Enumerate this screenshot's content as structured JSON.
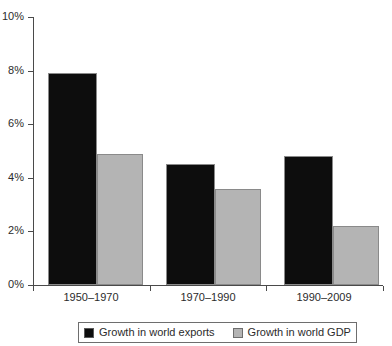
{
  "chart_data": {
    "type": "bar",
    "title": "",
    "subtitle": "",
    "xlabel": "",
    "ylabel": "",
    "categories": [
      "1950–1970",
      "1970–1990",
      "1990–2009"
    ],
    "series": [
      {
        "name": "Growth in world exports",
        "color": "#0d0d0d",
        "values": [
          7.9,
          4.5,
          4.8
        ]
      },
      {
        "name": "Growth in world GDP",
        "color": "#b4b4b4",
        "values": [
          4.9,
          3.6,
          2.2
        ]
      }
    ],
    "ylim": [
      0,
      10
    ],
    "ytick_values": [
      0,
      2,
      4,
      6,
      8,
      10
    ],
    "ytick_labels": [
      "0%",
      "2%",
      "4%",
      "6%",
      "8%",
      "10%"
    ],
    "grid": false,
    "legend_position": "bottom",
    "legend_entries": [
      "Growth in world exports",
      "Growth in world GDP"
    ]
  },
  "axes": {
    "y_labels": [
      "10%",
      "8%",
      "6%",
      "4%",
      "2%",
      "0%"
    ],
    "x_labels": [
      "1950–1970",
      "1970–1990",
      "1990–2009"
    ]
  },
  "legend": {
    "items": [
      {
        "label": "Growth in world exports",
        "swatch": "black-square-swatch"
      },
      {
        "label": "Growth in world GDP",
        "swatch": "gray-square-swatch"
      }
    ]
  }
}
